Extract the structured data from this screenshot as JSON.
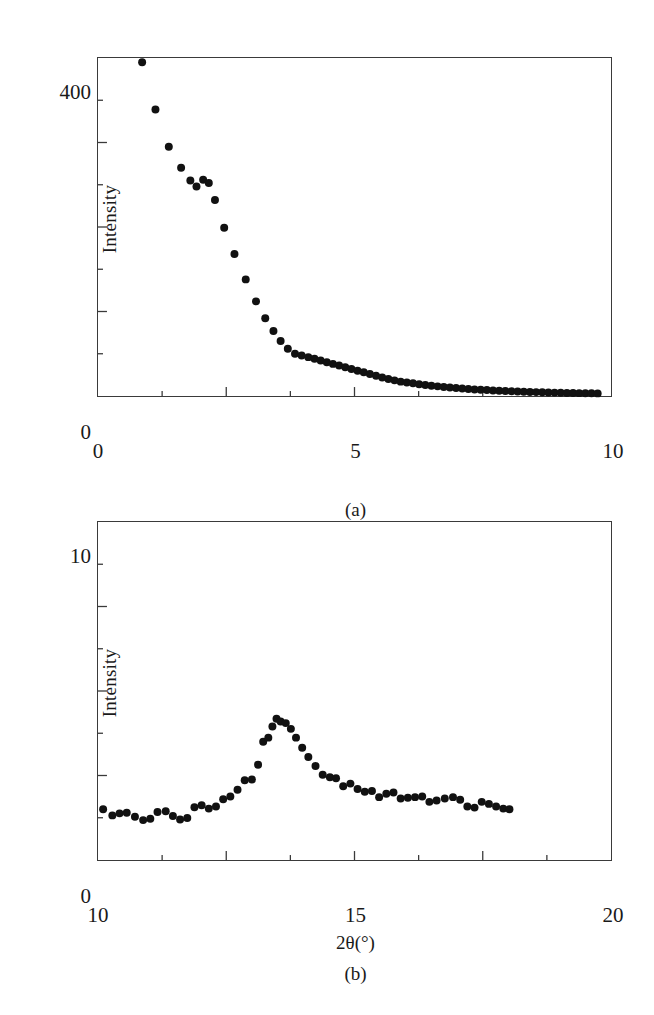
{
  "figure": {
    "background": "#ffffff",
    "marker_color": "#111111",
    "frame_color": "#3a3a3a"
  },
  "panels": [
    {
      "id": "a",
      "caption": "(a)",
      "ylabel": "Intensity",
      "xlabel": "",
      "y_top_label": "400",
      "y_bottom_label": "0",
      "x_ticks": [
        "0",
        "5",
        "10"
      ]
    },
    {
      "id": "b",
      "caption": "(b)",
      "ylabel": "Intensity",
      "xlabel": "2θ(°)",
      "y_top_label": "10",
      "y_bottom_label": "0",
      "x_ticks": [
        "10",
        "15",
        "20"
      ]
    }
  ],
  "chart_data": [
    {
      "type": "scatter",
      "title": "(a)",
      "xlabel": "",
      "ylabel": "Intensity",
      "xlim": [
        0,
        10
      ],
      "ylim": [
        0,
        400
      ],
      "xticks": [
        0,
        2.5,
        5,
        7.5,
        10
      ],
      "xticklabels": [
        "0",
        "",
        "5",
        "",
        "10"
      ],
      "yticks": [
        0,
        100,
        200,
        300,
        400
      ],
      "yticklabels": [
        "0",
        "",
        "",
        "",
        "400"
      ],
      "minor_ticks": true,
      "grid": false,
      "legend": null,
      "x": [
        0.86,
        1.12,
        1.38,
        1.62,
        1.8,
        1.92,
        2.05,
        2.16,
        2.28,
        2.46,
        2.66,
        2.88,
        3.08,
        3.26,
        3.42,
        3.56,
        3.7,
        3.84,
        3.97,
        4.1,
        4.22,
        4.34,
        4.46,
        4.58,
        4.7,
        4.82,
        4.94,
        5.06,
        5.18,
        5.3,
        5.42,
        5.54,
        5.66,
        5.78,
        5.9,
        6.02,
        6.14,
        6.26,
        6.38,
        6.5,
        6.62,
        6.74,
        6.86,
        6.98,
        7.1,
        7.22,
        7.34,
        7.46,
        7.58,
        7.7,
        7.82,
        7.94,
        8.06,
        8.18,
        8.3,
        8.42,
        8.54,
        8.66,
        8.78,
        8.9,
        9.02,
        9.14,
        9.26,
        9.38,
        9.5,
        9.62,
        9.74
      ],
      "y": [
        395,
        339,
        295,
        270,
        255,
        248,
        256,
        252,
        232,
        199,
        168,
        138,
        112,
        92,
        77,
        65,
        56,
        50,
        48,
        46,
        44,
        42,
        40,
        38,
        36,
        34,
        32,
        30,
        28,
        26,
        24,
        22,
        20,
        18.5,
        17,
        16,
        15,
        14,
        13,
        12.2,
        11.4,
        10.7,
        10,
        9.4,
        8.8,
        8.3,
        7.8,
        7.4,
        7.0,
        6.6,
        6.2,
        5.9,
        5.6,
        5.3,
        5.0,
        4.8,
        4.6,
        4.4,
        4.2,
        4.0,
        3.8,
        3.6,
        3.5,
        3.4,
        3.3,
        3.2,
        3.1
      ]
    },
    {
      "type": "scatter",
      "title": "(b)",
      "xlabel": "2θ(°)",
      "ylabel": "Intensity",
      "xlim": [
        10,
        20
      ],
      "ylim": [
        0,
        10
      ],
      "xticks": [
        10,
        12.5,
        15,
        17.5,
        20
      ],
      "xticklabels": [
        "10",
        "",
        "15",
        "",
        "20"
      ],
      "yticks": [
        0,
        2.5,
        5,
        7.5,
        10
      ],
      "yticklabels": [
        "0",
        "",
        "",
        "",
        "10"
      ],
      "minor_ticks": true,
      "grid": false,
      "legend": null,
      "x": [
        10.1,
        10.28,
        10.42,
        10.56,
        10.72,
        10.88,
        11.02,
        11.16,
        11.32,
        11.46,
        11.6,
        11.74,
        11.88,
        12.02,
        12.16,
        12.3,
        12.44,
        12.58,
        12.72,
        12.86,
        13.0,
        13.12,
        13.22,
        13.32,
        13.4,
        13.48,
        13.56,
        13.66,
        13.76,
        13.86,
        13.98,
        14.1,
        14.24,
        14.38,
        14.52,
        14.64,
        14.78,
        14.92,
        15.06,
        15.2,
        15.34,
        15.48,
        15.62,
        15.76,
        15.9,
        16.04,
        16.18,
        16.32,
        16.46,
        16.6,
        16.76,
        16.92,
        17.06,
        17.2,
        17.34,
        17.48,
        17.62,
        17.76,
        17.9,
        18.02
      ],
      "y": [
        1.5,
        1.32,
        1.38,
        1.4,
        1.28,
        1.18,
        1.22,
        1.42,
        1.44,
        1.3,
        1.2,
        1.24,
        1.56,
        1.62,
        1.52,
        1.58,
        1.8,
        1.88,
        2.08,
        2.36,
        2.38,
        2.82,
        3.5,
        3.62,
        3.95,
        4.18,
        4.1,
        4.05,
        3.88,
        3.62,
        3.32,
        3.05,
        2.78,
        2.52,
        2.45,
        2.42,
        2.18,
        2.26,
        2.1,
        2.02,
        2.04,
        1.86,
        1.96,
        2.0,
        1.82,
        1.84,
        1.86,
        1.88,
        1.72,
        1.76,
        1.82,
        1.86,
        1.78,
        1.58,
        1.55,
        1.72,
        1.66,
        1.58,
        1.52,
        1.5
      ]
    }
  ]
}
